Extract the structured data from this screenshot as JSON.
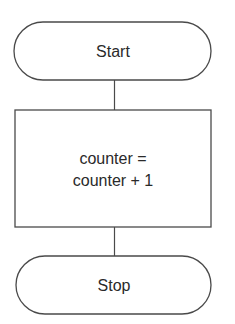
{
  "diagram": {
    "type": "flowchart",
    "nodes": [
      {
        "id": "start",
        "shape": "terminal",
        "label": "Start"
      },
      {
        "id": "process",
        "shape": "process",
        "label_lines": [
          "counter =",
          "counter + 1"
        ]
      },
      {
        "id": "stop",
        "shape": "terminal",
        "label": "Stop"
      }
    ],
    "edges": [
      {
        "from": "start",
        "to": "process"
      },
      {
        "from": "process",
        "to": "stop"
      }
    ],
    "colors": {
      "stroke": "#4a4a4a",
      "text": "#2a2a2a",
      "fill": "#ffffff"
    }
  }
}
